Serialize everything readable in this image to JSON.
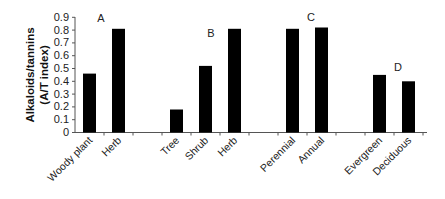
{
  "chart_data": {
    "type": "bar",
    "title": "",
    "xlabel": "",
    "ylabel": "Alkaloids/tannins (A/T index)",
    "ylabel_lines": [
      "Alkaloids/tannins",
      "(A/T index)"
    ],
    "ylim": [
      0,
      0.9
    ],
    "yticks": [
      "0",
      "0.1",
      "0.2",
      "0.3",
      "0.4",
      "0.5",
      "0.6",
      "0.7",
      "0.8",
      "0.9"
    ],
    "grid": false,
    "legend": null,
    "groups": [
      {
        "letter": "A",
        "categories": [
          "Woody plant",
          "Herb"
        ],
        "values": [
          0.46,
          0.81
        ]
      },
      {
        "letter": "B",
        "categories": [
          "Tree",
          "Shrub",
          "Herb"
        ],
        "values": [
          0.18,
          0.52,
          0.81
        ]
      },
      {
        "letter": "C",
        "categories": [
          "Perennial",
          "Annual"
        ],
        "values": [
          0.81,
          0.82
        ]
      },
      {
        "letter": "D",
        "categories": [
          "Evergreen",
          "Deciduous"
        ],
        "values": [
          0.45,
          0.4
        ]
      }
    ],
    "categories": [
      "Woody plant",
      "Herb",
      "",
      "Tree",
      "Shrub",
      "Herb",
      "",
      "Perennial",
      "Annual",
      "",
      "Evergreen",
      "Deciduous"
    ],
    "values": [
      0.46,
      0.81,
      null,
      0.18,
      0.52,
      0.81,
      null,
      0.81,
      0.82,
      null,
      0.45,
      0.4
    ],
    "annotations": [
      {
        "text": "A",
        "near": "group A"
      },
      {
        "text": "B",
        "near": "group B"
      },
      {
        "text": "C",
        "near": "group C"
      },
      {
        "text": "D",
        "near": "group D"
      }
    ]
  },
  "colors": {
    "bar": "#000000",
    "axis": "#555555",
    "text": "#222222"
  }
}
